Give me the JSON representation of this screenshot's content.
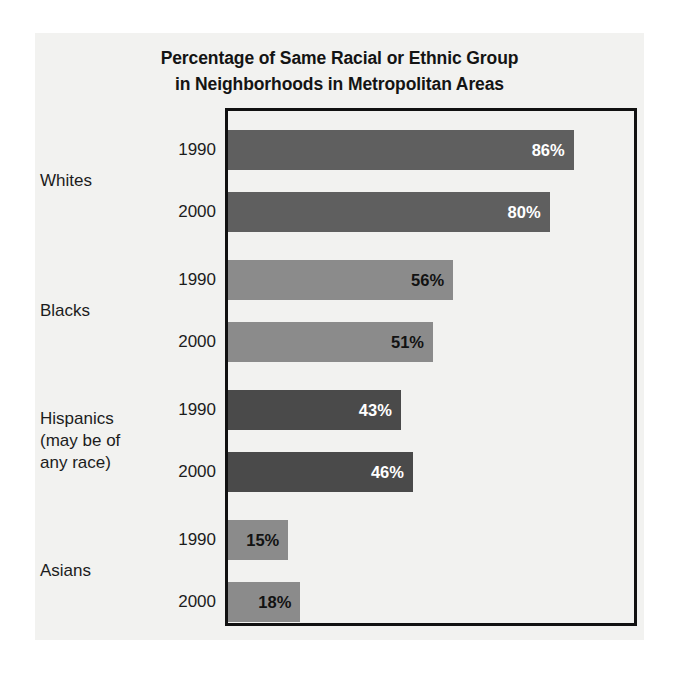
{
  "chart_data": {
    "type": "bar",
    "orientation": "horizontal",
    "title": "Percentage of Same Racial or Ethnic Group in Neighborhoods in Metropolitan Areas",
    "title_lines": [
      "Percentage of Same Racial or Ethnic Group",
      "in Neighborhoods in Metropolitan Areas"
    ],
    "xlabel": "",
    "ylabel": "",
    "xlim": [
      0,
      100
    ],
    "grid": false,
    "legend": false,
    "categories": [
      "Whites",
      "Blacks",
      "Hispanics (may be of any race)",
      "Asians"
    ],
    "series": [
      {
        "name": "1990",
        "values": [
          86,
          80,
          43,
          15
        ]
      },
      {
        "name": "2000",
        "values": [
          80,
          51,
          46,
          18
        ]
      }
    ],
    "groups": [
      {
        "label_lines": [
          "Whites"
        ],
        "bar_color": "#5f5f5f",
        "value_text_color": "#ffffff",
        "bars": [
          {
            "year": "1990",
            "value": 86,
            "value_label": "86%"
          },
          {
            "year": "2000",
            "value": 80,
            "value_label": "80%"
          }
        ]
      },
      {
        "label_lines": [
          "Blacks"
        ],
        "bar_color": "#8b8b8b",
        "value_text_color": "#121212",
        "bars": [
          {
            "year": "1990",
            "value": 56,
            "value_label": "56%"
          },
          {
            "year": "2000",
            "value": 51,
            "value_label": "51%"
          }
        ]
      },
      {
        "label_lines": [
          "Hispanics",
          "(may be of",
          "any race)"
        ],
        "bar_color": "#4a4a4a",
        "value_text_color": "#ffffff",
        "bars": [
          {
            "year": "1990",
            "value": 43,
            "value_label": "43%"
          },
          {
            "year": "2000",
            "value": 46,
            "value_label": "46%"
          }
        ]
      },
      {
        "label_lines": [
          "Asians"
        ],
        "bar_color": "#8b8b8b",
        "value_text_color": "#121212",
        "bars": [
          {
            "year": "1990",
            "value": 15,
            "value_label": "15%"
          },
          {
            "year": "2000",
            "value": 18,
            "value_label": "18%"
          }
        ]
      }
    ]
  },
  "style": {
    "page_background": "#ffffff",
    "figure_background": "#f2f2f0",
    "frame_color": "#111111",
    "text_color": "#1c1c1c"
  }
}
